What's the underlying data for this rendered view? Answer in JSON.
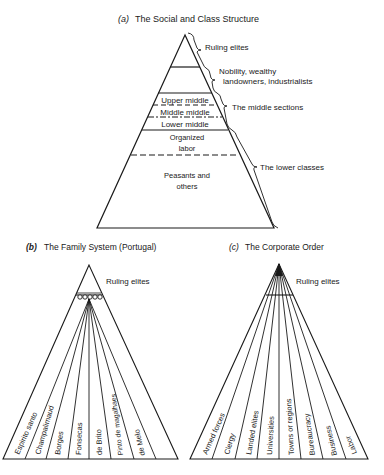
{
  "panel_a": {
    "title_letter": "(a)",
    "title": "The Social and Class Structure",
    "layers": {
      "upper_middle": "Upper middle",
      "middle_middle": "Middle middle",
      "lower_middle": "Lower middle",
      "organized_labor_1": "Organized",
      "organized_labor_2": "labor",
      "peasants_1": "Peasants and",
      "peasants_2": "others"
    },
    "brackets": {
      "ruling": "Ruling elites",
      "nobility_1": "Nobility, wealthy",
      "nobility_2": "landowners, industrialists",
      "middle": "The middle sections",
      "lower": "The lower classes"
    }
  },
  "panel_b": {
    "title_letter": "(b)",
    "title": "The Family System (Portugal)",
    "apex_label": "Ruling elites",
    "families": [
      "Espirito santo",
      "Champalimaud",
      "Borges",
      "Fonsecas",
      "de Brito",
      "Pinto de magalhaes",
      "de Melo"
    ]
  },
  "panel_c": {
    "title_letter": "(c)",
    "title": "The Corporate Order",
    "apex_label": "Ruling elites",
    "sectors": [
      "Armed forces",
      "Clergy",
      "Landed elites",
      "Universities",
      "Towns or regions",
      "Bureaucracy",
      "Business",
      "Labor"
    ]
  }
}
